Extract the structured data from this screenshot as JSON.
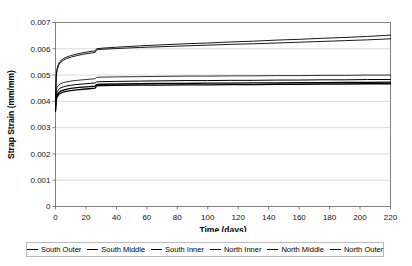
{
  "top_remnant_text": "",
  "chart_data": {
    "type": "line",
    "title": "",
    "xlabel": "Time (days)",
    "ylabel": "Strap Strain (mm/mm)",
    "xlim": [
      0,
      220
    ],
    "ylim": [
      0,
      0.007
    ],
    "xticks": [
      0,
      20,
      40,
      60,
      80,
      100,
      120,
      140,
      160,
      180,
      200,
      220
    ],
    "xtick_labels": [
      "0",
      "20",
      "40",
      "60",
      "80",
      "100",
      "120",
      "140",
      "160",
      "180",
      "200",
      "220"
    ],
    "yticks": [
      0,
      0.001,
      0.002,
      0.003,
      0.004,
      0.005,
      0.006,
      0.007
    ],
    "ytick_labels": [
      "0",
      "0.001",
      "0.002",
      "0.003",
      "0.004",
      "0.005",
      "0.006",
      "0.007"
    ],
    "grid": "horizontal",
    "legend_position": "bottom",
    "x": [
      0,
      0.5,
      1,
      2,
      3,
      5,
      7,
      10,
      14,
      18,
      22,
      26,
      27,
      30,
      40,
      55,
      70,
      85,
      100,
      115,
      130,
      145,
      160,
      175,
      190,
      205,
      220
    ],
    "series": [
      {
        "name": "South Outer",
        "line_width": 0.9,
        "color": "#000000",
        "values": [
          0.004,
          0.00498,
          0.00524,
          0.00543,
          0.00552,
          0.00562,
          0.00568,
          0.00574,
          0.0058,
          0.00585,
          0.00589,
          0.00592,
          0.006,
          0.00602,
          0.00606,
          0.00611,
          0.00615,
          0.00619,
          0.00622,
          0.00626,
          0.00629,
          0.00633,
          0.00636,
          0.0064,
          0.00643,
          0.00647,
          0.00652
        ]
      },
      {
        "name": "South Middle",
        "line_width": 0.9,
        "color": "#000000",
        "values": [
          0.00398,
          0.00492,
          0.00518,
          0.00537,
          0.00546,
          0.00556,
          0.00562,
          0.00568,
          0.00574,
          0.00579,
          0.00583,
          0.00586,
          0.00596,
          0.00598,
          0.00601,
          0.00605,
          0.00608,
          0.00611,
          0.00614,
          0.00617,
          0.00619,
          0.00622,
          0.00625,
          0.00628,
          0.00631,
          0.00634,
          0.00638
        ]
      },
      {
        "name": "South Inner",
        "line_width": 0.8,
        "color": "#000000",
        "values": [
          0.00392,
          0.0044,
          0.00452,
          0.00461,
          0.00466,
          0.00471,
          0.00474,
          0.00477,
          0.0048,
          0.00482,
          0.00484,
          0.00486,
          0.00491,
          0.00492,
          0.00493,
          0.00494,
          0.00495,
          0.00496,
          0.00496,
          0.00497,
          0.00497,
          0.00498,
          0.00498,
          0.00499,
          0.00499,
          0.005,
          0.005
        ]
      },
      {
        "name": "North Inner",
        "line_width": 1.0,
        "color": "#000000",
        "values": [
          0.00378,
          0.00424,
          0.00436,
          0.00445,
          0.0045,
          0.00455,
          0.00458,
          0.00461,
          0.00464,
          0.00466,
          0.00468,
          0.0047,
          0.00474,
          0.00475,
          0.00476,
          0.00477,
          0.00478,
          0.00479,
          0.00479,
          0.0048,
          0.0048,
          0.00481,
          0.00481,
          0.00482,
          0.00482,
          0.00483,
          0.00483
        ]
      },
      {
        "name": "North Middle",
        "line_width": 1.3,
        "color": "#000000",
        "values": [
          0.00368,
          0.00412,
          0.00424,
          0.00433,
          0.00438,
          0.00443,
          0.00446,
          0.00449,
          0.00452,
          0.00454,
          0.00456,
          0.00458,
          0.00464,
          0.00465,
          0.00466,
          0.00467,
          0.00468,
          0.00468,
          0.00469,
          0.00469,
          0.0047,
          0.0047,
          0.00471,
          0.00471,
          0.00472,
          0.00472,
          0.00473
        ]
      },
      {
        "name": "North Outer",
        "line_width": 1.3,
        "color": "#000000",
        "values": [
          0.00362,
          0.00404,
          0.00416,
          0.00425,
          0.0043,
          0.00435,
          0.00438,
          0.00441,
          0.00444,
          0.00446,
          0.00448,
          0.0045,
          0.00459,
          0.0046,
          0.00461,
          0.00462,
          0.00462,
          0.00463,
          0.00463,
          0.00464,
          0.00464,
          0.00465,
          0.00465,
          0.00466,
          0.00466,
          0.00467,
          0.00467
        ]
      }
    ]
  },
  "legend": {
    "items": [
      {
        "label": "South Outer"
      },
      {
        "label": "South Middle"
      },
      {
        "label": "South Inner"
      },
      {
        "label": "North Inner"
      },
      {
        "label": "North Middle"
      },
      {
        "label": "North Outer"
      }
    ]
  }
}
